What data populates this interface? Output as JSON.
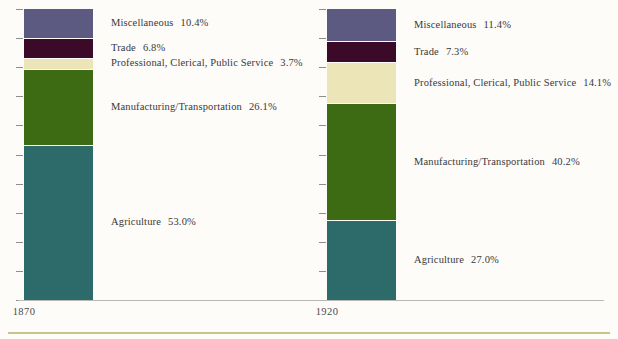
{
  "chart_data": {
    "type": "bar",
    "subtype": "stacked-100-percent",
    "title": "",
    "subtitle": "",
    "xlabel": "",
    "ylabel": "",
    "ylim": [
      0,
      100
    ],
    "grid": false,
    "legend_position": "inline-right-of-bar",
    "categories": [
      "1870",
      "1920"
    ],
    "series": [
      {
        "name": "Agriculture",
        "values": [
          53.0,
          27.0
        ],
        "color": "#2d6b6b"
      },
      {
        "name": "Manufacturing/Transportation",
        "values": [
          26.1,
          40.2
        ],
        "color": "#3d6b14"
      },
      {
        "name": "Professional, Clerical, Public Service",
        "values": [
          3.7,
          14.1
        ],
        "color": "#ece5b8"
      },
      {
        "name": "Trade",
        "values": [
          6.8,
          7.3
        ],
        "color": "#3a0a28"
      },
      {
        "name": "Miscellaneous",
        "values": [
          10.4,
          11.4
        ],
        "color": "#5c5a80"
      }
    ],
    "annotations": [
      "Miscellaneous  10.4%",
      "Trade  6.8%",
      "Professional, Clerical, Public Service  3.7%",
      "Manufacturing/Transportation  26.1%",
      "Agriculture  53.0%",
      "Miscellaneous  11.4%",
      "Trade  7.3%",
      "Professional, Clerical, Public Service  14.1%",
      "Manufacturing/Transportation  40.2%",
      "Agriculture  27.0%"
    ]
  },
  "colors": {
    "agriculture": "#2d6b6b",
    "manufacturing": "#3d6b14",
    "professional": "#ece5b8",
    "trade": "#3a0a28",
    "miscellaneous": "#5c5a80",
    "background": "#fdfcf9",
    "axis": "#b9b9b4",
    "rule": "#c9c58a",
    "text": "#39393a"
  },
  "bars": [
    {
      "year": "1870",
      "segments": [
        {
          "name": "Miscellaneous",
          "pct": "10.4%",
          "label": "Miscellaneous",
          "value": 10.4
        },
        {
          "name": "Trade",
          "pct": "6.8%",
          "label": "Trade",
          "value": 6.8
        },
        {
          "name": "Professional, Clerical, Public Service",
          "pct": "3.7%",
          "label": "Professional, Clerical, Public Service",
          "value": 3.7
        },
        {
          "name": "Manufacturing/Transportation",
          "pct": "26.1%",
          "label": "Manufacturing/Transportation",
          "value": 26.1
        },
        {
          "name": "Agriculture",
          "pct": "53.0%",
          "label": "Agriculture",
          "value": 53.0
        }
      ]
    },
    {
      "year": "1920",
      "segments": [
        {
          "name": "Miscellaneous",
          "pct": "11.4%",
          "label": "Miscellaneous",
          "value": 11.4
        },
        {
          "name": "Trade",
          "pct": "7.3%",
          "label": "Trade",
          "value": 7.3
        },
        {
          "name": "Professional, Clerical, Public Service",
          "pct": "14.1%",
          "label": "Professional, Clerical, Public Service",
          "value": 14.1
        },
        {
          "name": "Manufacturing/Transportation",
          "pct": "40.2%",
          "label": "Manufacturing/Transportation",
          "value": 40.2
        },
        {
          "name": "Agriculture",
          "pct": "27.0%",
          "label": "Agriculture",
          "value": 27.0
        }
      ]
    }
  ],
  "axis": {
    "tick_count": 11
  }
}
